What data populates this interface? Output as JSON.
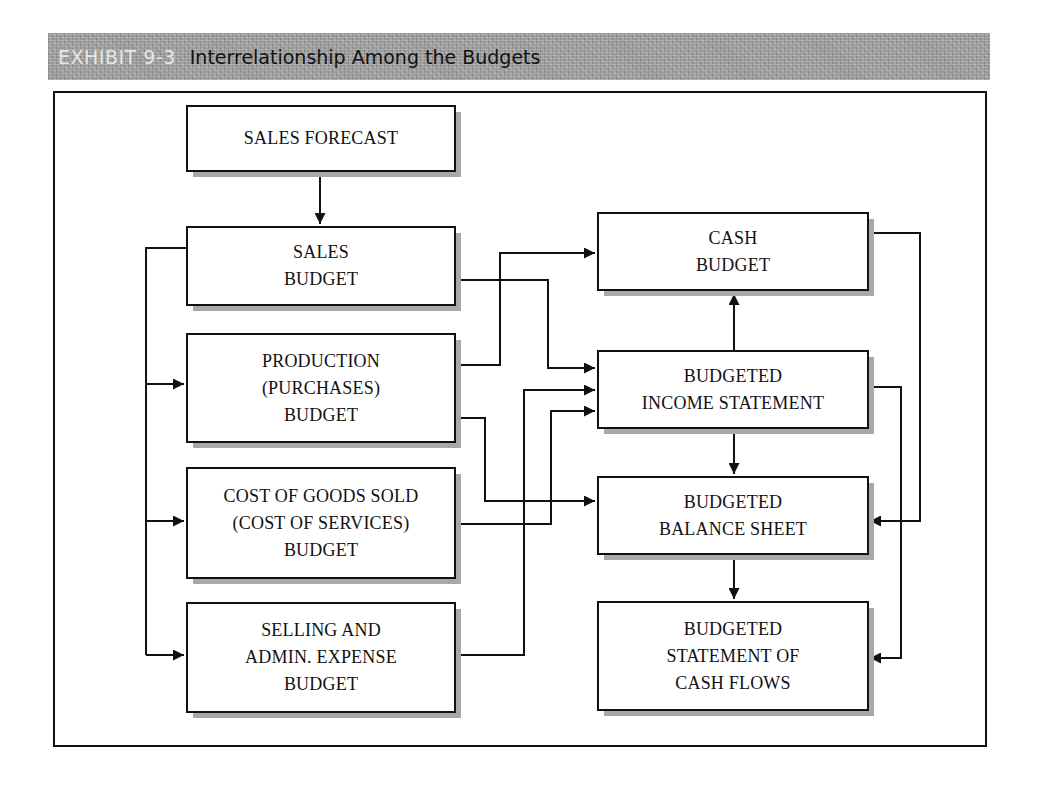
{
  "header": {
    "exhibit_label": "EXHIBIT 9-3",
    "title": "Interrelationship Among the Budgets"
  },
  "boxes": {
    "sales_forecast": {
      "lines": [
        "SALES FORECAST"
      ]
    },
    "sales_budget": {
      "lines": [
        "SALES",
        "BUDGET"
      ]
    },
    "production_budget": {
      "lines": [
        "PRODUCTION",
        "(PURCHASES)",
        "BUDGET"
      ]
    },
    "cogs_budget": {
      "lines": [
        "COST OF GOODS SOLD",
        "(COST OF SERVICES)",
        "BUDGET"
      ]
    },
    "selling_admin_budget": {
      "lines": [
        "SELLING AND",
        "ADMIN. EXPENSE",
        "BUDGET"
      ]
    },
    "cash_budget": {
      "lines": [
        "CASH",
        "BUDGET"
      ]
    },
    "budgeted_income_statement": {
      "lines": [
        "BUDGETED",
        "INCOME STATEMENT"
      ]
    },
    "budgeted_balance_sheet": {
      "lines": [
        "BUDGETED",
        "BALANCE SHEET"
      ]
    },
    "budgeted_cash_flows": {
      "lines": [
        "BUDGETED",
        "STATEMENT OF",
        "CASH FLOWS"
      ]
    }
  },
  "connections": [
    {
      "from": "SALES FORECAST",
      "to": "SALES BUDGET"
    },
    {
      "from": "SALES BUDGET",
      "to": "PRODUCTION (PURCHASES) BUDGET"
    },
    {
      "from": "SALES BUDGET",
      "to": "COST OF GOODS SOLD (COST OF SERVICES) BUDGET"
    },
    {
      "from": "SALES BUDGET",
      "to": "SELLING AND ADMIN. EXPENSE BUDGET"
    },
    {
      "from": "SALES BUDGET",
      "to": "BUDGETED INCOME STATEMENT"
    },
    {
      "from": "PRODUCTION (PURCHASES) BUDGET",
      "to": "CASH BUDGET"
    },
    {
      "from": "PRODUCTION (PURCHASES) BUDGET",
      "to": "BUDGETED BALANCE SHEET"
    },
    {
      "from": "COST OF GOODS SOLD (COST OF SERVICES) BUDGET",
      "to": "BUDGETED INCOME STATEMENT"
    },
    {
      "from": "SELLING AND ADMIN. EXPENSE BUDGET",
      "to": "BUDGETED INCOME STATEMENT"
    },
    {
      "from": "BUDGETED INCOME STATEMENT",
      "to": "CASH BUDGET"
    },
    {
      "from": "BUDGETED INCOME STATEMENT",
      "to": "BUDGETED BALANCE SHEET"
    },
    {
      "from": "BUDGETED INCOME STATEMENT",
      "to": "BUDGETED STATEMENT OF CASH FLOWS"
    },
    {
      "from": "CASH BUDGET",
      "to": "BUDGETED BALANCE SHEET"
    },
    {
      "from": "BUDGETED BALANCE SHEET",
      "to": "BUDGETED STATEMENT OF CASH FLOWS"
    }
  ]
}
